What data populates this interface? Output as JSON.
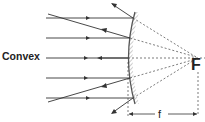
{
  "diagram": {
    "title_label": "Convex",
    "focal_point_label": "F",
    "focal_length_label": "f",
    "colors": {
      "ray": "#333333",
      "mirror": "#555555",
      "hatch": "#aaaaaa",
      "dashed": "#444444"
    }
  }
}
